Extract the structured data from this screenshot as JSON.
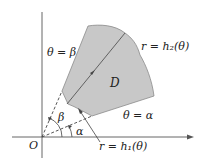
{
  "diagram": {
    "labels": {
      "theta_beta": "θ = β",
      "theta_alpha": "θ = α",
      "r_h2": "r = h₂(θ)",
      "r_h1": "r = h₁(θ)",
      "region": "D",
      "origin": "O",
      "angle_beta": "β",
      "angle_alpha": "α"
    },
    "colors": {
      "region_fill": "#c8c8c8",
      "region_stroke": "#7a7a7a",
      "axis": "#555555",
      "text": "#222222"
    }
  }
}
